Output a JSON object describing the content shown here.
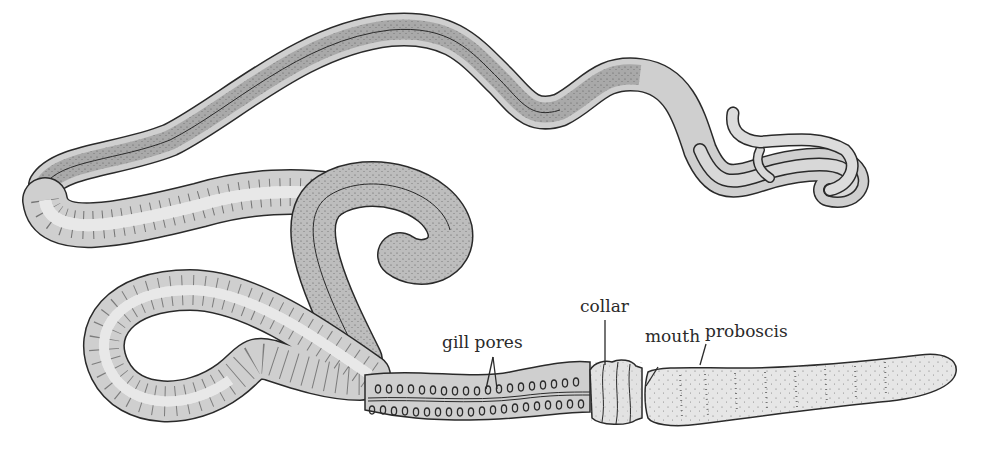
{
  "figure": {
    "colors": {
      "outline": "#2a2a2a",
      "body_fill": "#cfcfcf",
      "dark_band": "#a9a9a9",
      "light_band": "#e6e6e6",
      "proboscis_fill": "#e4e4e4",
      "background": "#ffffff"
    }
  },
  "labels": {
    "gill_pores": "gill pores",
    "collar": "collar",
    "mouth": "mouth",
    "proboscis": "proboscis"
  }
}
